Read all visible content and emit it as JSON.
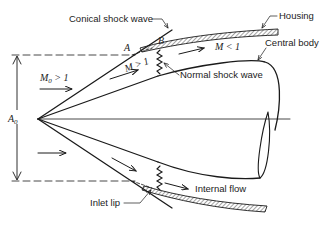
{
  "diagram": {
    "type": "supersonic-inlet-cross-section",
    "labels": {
      "conical_shock": "Conical shock wave",
      "housing": "Housing",
      "central_body": "Central body",
      "normal_shock": "Normal shock wave",
      "internal_flow": "Internal flow",
      "inlet_lip": "Inlet lip",
      "point_a": "A",
      "point_b": "B",
      "capture_area": "A",
      "capture_area_sub": "0",
      "freestream_mach": "M",
      "freestream_mach_sub": "0",
      "freestream_mach_rel": " > 1",
      "post_conical_mach": "M > 1",
      "subsonic_mach": "M < 1"
    },
    "colors": {
      "line": "#1a1a1a",
      "text": "#222222",
      "background": "#ffffff"
    }
  }
}
